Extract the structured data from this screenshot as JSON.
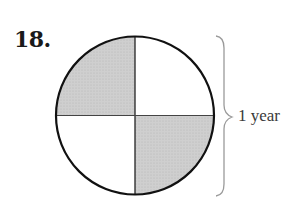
{
  "problem": {
    "number": "18."
  },
  "diagram": {
    "type": "fraction-circle",
    "parts": 4,
    "shaded_parts": 2,
    "shaded_quadrants": [
      "top-left",
      "bottom-right"
    ],
    "shade_color": "#c8c8c8",
    "outline_color": "#111111",
    "brace_color": "#9a9a9a",
    "label": "1 year"
  }
}
